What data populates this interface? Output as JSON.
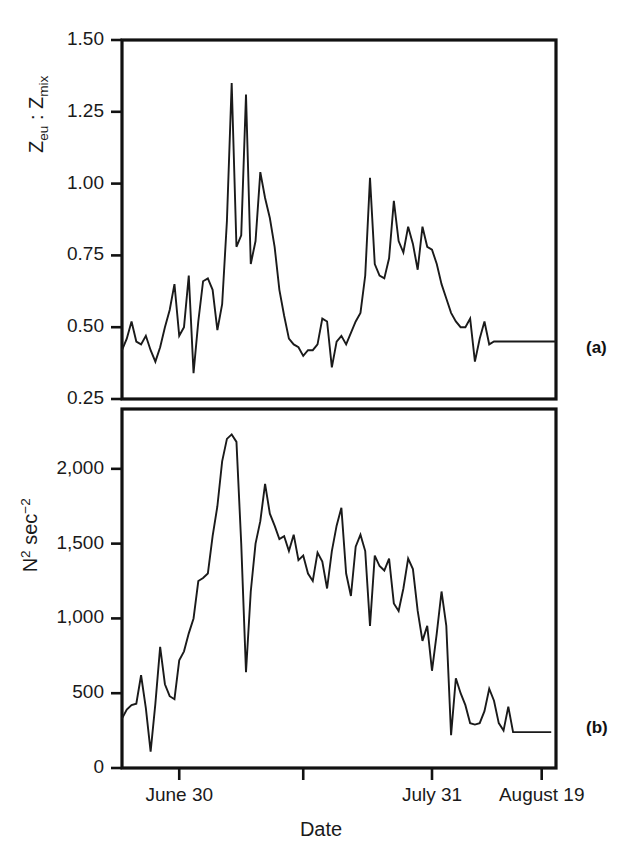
{
  "figure": {
    "panel_a_tag": "(a)",
    "panel_b_tag": "(b)",
    "xlabel": "Date"
  },
  "chart_data": [
    {
      "id": "panel-a",
      "type": "line",
      "title": "",
      "panel_label": "(a)",
      "xlabel": "Date",
      "ylabel": "Zeu : Zmix",
      "ylabel_parts": {
        "base1": "Z",
        "sub1": "eu",
        "sep": " : ",
        "base2": "Z",
        "sub2": "mix"
      },
      "ylim": [
        0.25,
        1.5
      ],
      "ytick_labels": [
        "1.50",
        "1.25",
        "1.00",
        "0.75",
        "0.50",
        "0.25"
      ],
      "ytick_values": [
        1.5,
        1.25,
        1.0,
        0.75,
        0.5,
        0.25
      ],
      "xtick_labels": [
        "June 30",
        "",
        "July 31",
        "August 19"
      ],
      "xtick_index": [
        12,
        38,
        65,
        88
      ],
      "xlim": [
        0,
        91
      ],
      "grid": false,
      "legend": "none",
      "x": [
        0,
        1,
        2,
        3,
        4,
        5,
        6,
        7,
        8,
        9,
        10,
        11,
        12,
        13,
        14,
        15,
        16,
        17,
        18,
        19,
        20,
        21,
        22,
        23,
        24,
        25,
        26,
        27,
        28,
        29,
        30,
        31,
        32,
        33,
        34,
        35,
        36,
        37,
        38,
        39,
        40,
        41,
        42,
        43,
        44,
        45,
        46,
        47,
        48,
        49,
        50,
        51,
        52,
        53,
        54,
        55,
        56,
        57,
        58,
        59,
        60,
        61,
        62,
        63,
        64,
        65,
        66,
        67,
        68,
        69,
        70,
        71,
        72,
        73,
        74,
        75,
        76,
        77,
        78,
        79,
        80,
        81,
        82,
        83,
        84,
        85,
        86,
        87,
        88,
        89,
        90,
        91
      ],
      "values": [
        0.42,
        0.46,
        0.52,
        0.45,
        0.44,
        0.47,
        0.42,
        0.38,
        0.43,
        0.5,
        0.56,
        0.65,
        0.47,
        0.5,
        0.68,
        0.34,
        0.52,
        0.66,
        0.67,
        0.63,
        0.49,
        0.58,
        0.87,
        1.35,
        0.78,
        0.82,
        1.31,
        0.72,
        0.8,
        1.04,
        0.95,
        0.88,
        0.78,
        0.63,
        0.54,
        0.46,
        0.44,
        0.43,
        0.4,
        0.42,
        0.42,
        0.44,
        0.53,
        0.52,
        0.36,
        0.45,
        0.47,
        0.44,
        0.48,
        0.52,
        0.55,
        0.68,
        1.02,
        0.72,
        0.68,
        0.67,
        0.74,
        0.94,
        0.8,
        0.76,
        0.85,
        0.79,
        0.7,
        0.85,
        0.78,
        0.77,
        0.72,
        0.65,
        0.6,
        0.55,
        0.52,
        0.5,
        0.5,
        0.53,
        0.38,
        0.46,
        0.52,
        0.44,
        0.45,
        0.45,
        0.45,
        0.45,
        0.45,
        0.45,
        0.45,
        0.45,
        0.45,
        0.45,
        0.45,
        0.45,
        0.45,
        0.45
      ]
    },
    {
      "id": "panel-b",
      "type": "line",
      "title": "",
      "panel_label": "(b)",
      "xlabel": "Date",
      "ylabel": "N2 sec-2",
      "ylabel_parts": {
        "base1": "N",
        "sup1": "2",
        "base2": " sec",
        "sup2": "−2"
      },
      "ylim": [
        0,
        2400
      ],
      "ytick_labels": [
        "2,000",
        "1,500",
        "1,000",
        "500",
        "0"
      ],
      "ytick_values": [
        2000,
        1500,
        1000,
        500,
        0
      ],
      "xtick_labels": [
        "June 30",
        "",
        "July 31",
        "August 19"
      ],
      "xtick_index": [
        12,
        38,
        65,
        88
      ],
      "xlim": [
        0,
        91
      ],
      "grid": false,
      "legend": "none",
      "x": [
        0,
        1,
        2,
        3,
        4,
        5,
        6,
        7,
        8,
        9,
        10,
        11,
        12,
        13,
        14,
        15,
        16,
        17,
        18,
        19,
        20,
        21,
        22,
        23,
        24,
        25,
        26,
        27,
        28,
        29,
        30,
        31,
        32,
        33,
        34,
        35,
        36,
        37,
        38,
        39,
        40,
        41,
        42,
        43,
        44,
        45,
        46,
        47,
        48,
        49,
        50,
        51,
        52,
        53,
        54,
        55,
        56,
        57,
        58,
        59,
        60,
        61,
        62,
        63,
        64,
        65,
        66,
        67,
        68,
        69,
        70,
        71,
        72,
        73,
        74,
        75,
        76,
        77,
        78,
        79,
        80,
        81,
        82,
        83,
        84,
        85,
        86,
        87,
        88,
        89,
        90,
        91
      ],
      "values": [
        330,
        390,
        420,
        430,
        620,
        400,
        110,
        430,
        810,
        560,
        480,
        460,
        720,
        780,
        900,
        1000,
        1250,
        1270,
        1300,
        1550,
        1750,
        2050,
        2200,
        2230,
        2180,
        1500,
        640,
        1180,
        1500,
        1650,
        1900,
        1700,
        1620,
        1530,
        1550,
        1450,
        1560,
        1390,
        1420,
        1300,
        1250,
        1440,
        1380,
        1200,
        1450,
        1620,
        1740,
        1300,
        1150,
        1480,
        1560,
        1450,
        950,
        1420,
        1350,
        1320,
        1400,
        1100,
        1050,
        1200,
        1400,
        1330,
        1050,
        850,
        950,
        650,
        900,
        1180,
        950,
        220,
        600,
        500,
        420,
        300,
        290,
        300,
        380,
        530,
        450,
        300,
        250,
        410,
        240,
        240,
        240,
        240,
        240,
        240,
        240,
        240,
        240
      ]
    }
  ]
}
